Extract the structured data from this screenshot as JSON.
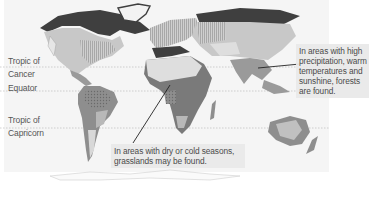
{
  "map": {
    "type": "world biome map",
    "palette": {
      "ocean": "#f5f5f5",
      "tundra_boreal": "#3f3f3f",
      "temperate": "#c8c8c8",
      "desert": "#dedede",
      "savanna": "#7a7a7a",
      "tropical_forest": "#9a9a9a",
      "grassland_hatched": "#b0b0b0",
      "mountain": "#e6e6e6",
      "divider_line": "#bdbdbd",
      "pointer_line": "#222222",
      "callout_bg": "#e8e8e8",
      "text": "#4a4a4a"
    },
    "latitude_lines": [
      {
        "id": "tropic-of-cancer",
        "lines": [
          "Tropic of",
          "Cancer"
        ],
        "y": 67
      },
      {
        "id": "equator",
        "lines": [
          "Equator"
        ],
        "y": 95
      },
      {
        "id": "tropic-of-capricorn",
        "lines": [
          "Tropic of",
          "Capricorn"
        ],
        "y": 130
      }
    ]
  },
  "labels": {
    "cancer_line1": "Tropic of",
    "cancer_line2": "Cancer",
    "equator": "Equator",
    "capricorn_line1": "Tropic of",
    "capricorn_line2": "Capricorn"
  },
  "callouts": {
    "forests": {
      "lines": [
        "In areas with high",
        "precipitation, warm",
        "temperatures and",
        "sunshine, forests",
        "are found."
      ]
    },
    "grasslands": {
      "lines": [
        "In areas with dry or cold seasons,",
        "grasslands may be found."
      ]
    }
  }
}
